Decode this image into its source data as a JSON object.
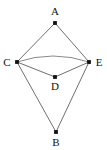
{
  "figure": {
    "type": "graph-diagram",
    "background_color": "#ffffff",
    "edge_color": "#4a4a4a",
    "arc_color": "#6b6b6b",
    "vertex_color": "#111111"
  },
  "vertices": [
    {
      "id": "A",
      "label": "A",
      "x": 55,
      "y": 23,
      "label_x": 55,
      "label_y": 15
    },
    {
      "id": "B",
      "label": "B",
      "x": 56,
      "y": 132,
      "label_x": 56,
      "label_y": 146
    },
    {
      "id": "C",
      "label": "C",
      "x": 17,
      "y": 62,
      "label_x": 7,
      "label_y": 66
    },
    {
      "id": "D",
      "label": "D",
      "x": 55,
      "y": 77,
      "label_x": 55,
      "label_y": 90
    },
    {
      "id": "E",
      "label": "E",
      "x": 89,
      "y": 62,
      "label_x": 99,
      "label_y": 66
    }
  ],
  "edges": [
    {
      "from": "A",
      "to": "C",
      "shape": "line"
    },
    {
      "from": "A",
      "to": "E",
      "shape": "line"
    },
    {
      "from": "C",
      "to": "E",
      "shape": "arc",
      "curve_peak_y": 56
    },
    {
      "from": "C",
      "to": "D",
      "shape": "line"
    },
    {
      "from": "D",
      "to": "E",
      "shape": "line"
    },
    {
      "from": "C",
      "to": "B",
      "shape": "line"
    },
    {
      "from": "E",
      "to": "B",
      "shape": "line"
    }
  ]
}
